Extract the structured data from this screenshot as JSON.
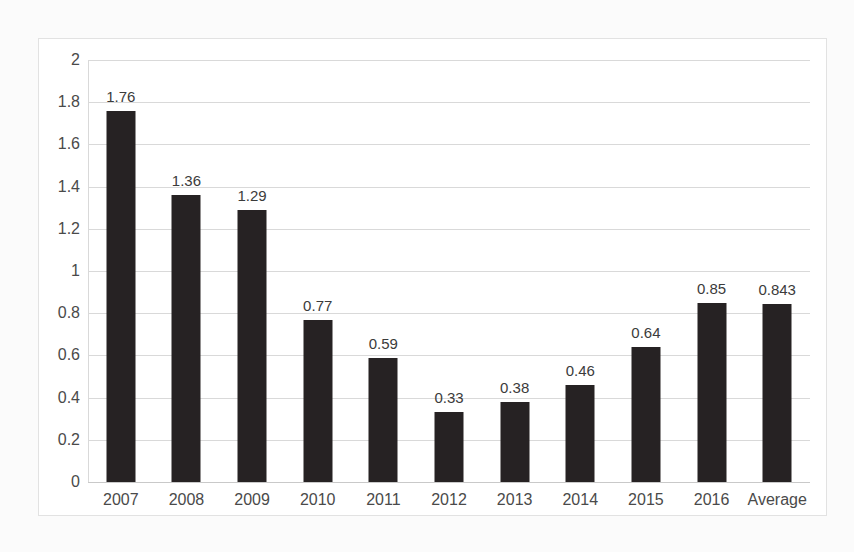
{
  "chart_data": {
    "type": "bar",
    "title": "",
    "subtitle": "",
    "xlabel": "",
    "ylabel": "",
    "categories": [
      "2007",
      "2008",
      "2009",
      "2010",
      "2011",
      "2012",
      "2013",
      "2014",
      "2015",
      "2016",
      "Average"
    ],
    "values": [
      1.76,
      1.36,
      1.29,
      0.77,
      0.59,
      0.33,
      0.38,
      0.46,
      0.64,
      0.85,
      0.843
    ],
    "value_labels": [
      "1.76",
      "1.36",
      "1.29",
      "0.77",
      "0.59",
      "0.33",
      "0.38",
      "0.46",
      "0.64",
      "0.85",
      "0.843"
    ],
    "ylim": [
      0,
      2
    ],
    "y_ticks": [
      2,
      1.8,
      1.6,
      1.4,
      1.2,
      1,
      0.8,
      0.6,
      0.4,
      0.2,
      0
    ],
    "y_tick_labels": [
      "2",
      "1.8",
      "1.6",
      "1.4",
      "1.2",
      "1",
      "0.8",
      "0.6",
      "0.4",
      "0.2",
      "0"
    ],
    "grid": true,
    "legend": false,
    "legend_position": "none",
    "bar_color": "#262223",
    "gridline_color": "#d9d9d9",
    "plot_background": "#ffffff",
    "page_background": "#fbfbfb",
    "data_label_color": "#3b3b3b",
    "axis_label_color": "#4a4a4a"
  }
}
